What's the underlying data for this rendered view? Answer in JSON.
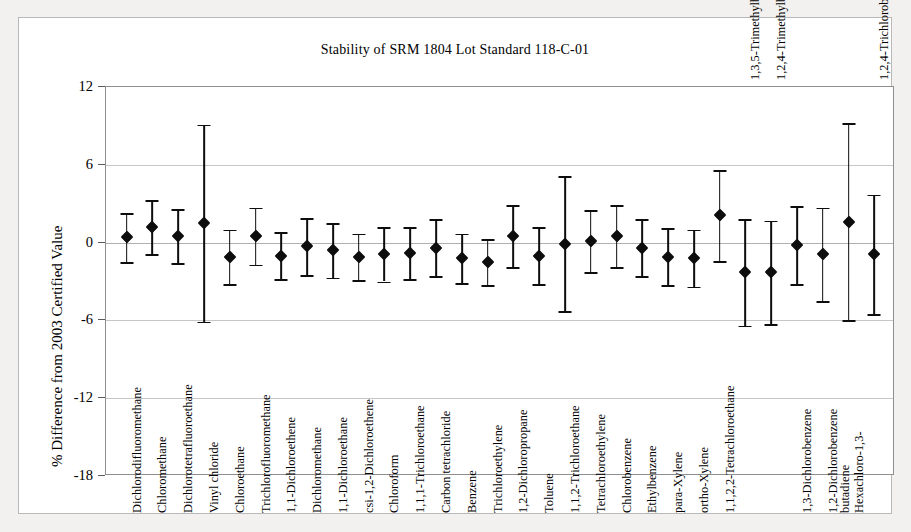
{
  "figure": {
    "title": "Stability of SRM 1804 Lot Standard 118-C-01",
    "ylabel": "% Difference from 2003 Certified Value"
  },
  "chart_data": {
    "type": "scatter",
    "title": "Stability of SRM 1804 Lot Standard 118-C-01",
    "xlabel": "",
    "ylabel": "% Difference from 2003 Certified Value",
    "ylim": [
      -18,
      12
    ],
    "yticks": [
      "12",
      "6",
      "0",
      "-6",
      "-12",
      "-18"
    ],
    "ytick_values": [
      12,
      6,
      0,
      -6,
      -12,
      -18
    ],
    "grid": true,
    "legend": "none",
    "error_bars": "vertical, symmetric caps",
    "marker": "filled diamond",
    "categories": [
      "Dichlorodifluoromethane",
      "Chloromethane",
      "Dichlorotetrafluoroethane",
      "Vinyl chloride",
      "Chloroethane",
      "Trichlorofluoromethane",
      "1,1-Dichloroethene",
      "Dichloromethane",
      "1,1-Dichloroethane",
      "csi-1,2-Dichloroethene",
      "Chloroform",
      "1,1,1-Trichloroethane",
      "Carbon tetrachloride",
      "Benzene",
      "Trichloroethylene",
      "1,2-Dichloropropane",
      "Toluene",
      "1,1,2-Trichloroethane",
      "Tetrachloroethylene",
      "Chlorobenzene",
      "Ethylbenzene",
      "para-Xylene",
      "ortho-Xylene",
      "1,1,2,2-Tetrachloroethane",
      "1,3,5-Trimethylbenzene",
      "1,2,4-Trimethylbenzene",
      "1,3-Dichlorobenzene",
      "1,2-Dichlorobenzene",
      "Hexachloro-1,3-butadiene",
      "1,2,4-Trichlorobenzene"
    ],
    "label_position": [
      "below",
      "below",
      "below",
      "below",
      "below",
      "below",
      "below",
      "below",
      "below",
      "below",
      "below",
      "below",
      "below",
      "below",
      "below",
      "below",
      "below",
      "below",
      "below",
      "below",
      "below",
      "below",
      "below",
      "below",
      "above",
      "above",
      "below",
      "below",
      "below",
      "above"
    ],
    "label_lines": [
      [
        "Dichlorodifluoromethane"
      ],
      [
        "Chloromethane"
      ],
      [
        "Dichlorotetrafluoroethane"
      ],
      [
        "Vinyl chloride"
      ],
      [
        "Chloroethane"
      ],
      [
        "Trichlorofluoromethane"
      ],
      [
        "1,1-Dichloroethene"
      ],
      [
        "Dichloromethane"
      ],
      [
        "1,1-Dichloroethane"
      ],
      [
        "csi-1,2-Dichloroethene"
      ],
      [
        "Chloroform"
      ],
      [
        "1,1,1-Trichloroethane"
      ],
      [
        "Carbon tetrachloride"
      ],
      [
        "Benzene"
      ],
      [
        "Trichloroethylene"
      ],
      [
        "1,2-Dichloropropane"
      ],
      [
        "Toluene"
      ],
      [
        "1,1,2-Trichloroethane"
      ],
      [
        "Tetrachloroethylene"
      ],
      [
        "Chlorobenzene"
      ],
      [
        "Ethylbenzene"
      ],
      [
        "para-Xylene"
      ],
      [
        "ortho-Xylene"
      ],
      [
        "1,1,2,2-Tetrachloroethane"
      ],
      [
        "1,3,5-Trimethylbenzene"
      ],
      [
        "1,2,4-Trimethylbenzene"
      ],
      [
        "1,3-Dichlorobenzene"
      ],
      [
        "1,2-Dichlorobenzene"
      ],
      [
        "Hexachloro-1,3-",
        "butadiene"
      ],
      [
        "1,2,4-Trichlorobenzene"
      ]
    ],
    "values": [
      0.4,
      1.2,
      0.5,
      1.5,
      -1.1,
      0.5,
      -1.0,
      -0.3,
      -0.6,
      -1.1,
      -0.9,
      -0.8,
      -0.4,
      -1.2,
      -1.5,
      0.5,
      -1.0,
      -0.1,
      0.1,
      0.5,
      -0.4,
      -1.1,
      -1.2,
      2.1,
      -2.3,
      -2.3,
      -0.2,
      -0.9,
      1.6,
      -0.9
    ],
    "errors": [
      1.9,
      2.1,
      2.1,
      7.6,
      2.1,
      2.2,
      1.8,
      2.2,
      2.1,
      1.8,
      2.1,
      2.0,
      2.2,
      1.9,
      1.8,
      2.4,
      2.2,
      5.2,
      2.4,
      2.4,
      2.2,
      2.2,
      2.2,
      3.5,
      4.1,
      4.0,
      3.0,
      3.6,
      7.6,
      4.6
    ]
  }
}
